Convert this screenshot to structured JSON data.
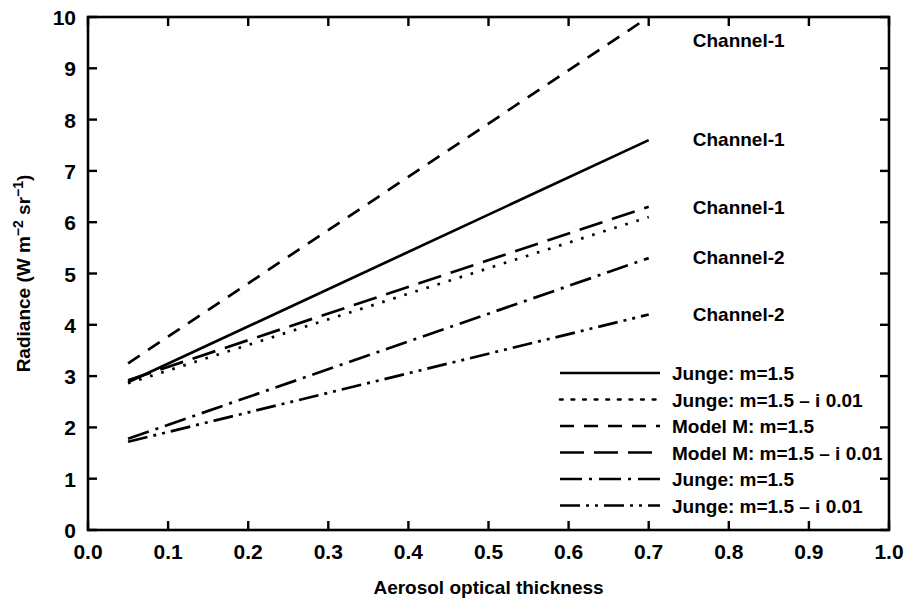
{
  "chart_data": {
    "type": "line",
    "title": "",
    "xlabel": "Aerosol optical thickness",
    "ylabel": "Radiance (W m-2 sr-1)",
    "ylabel_parts": {
      "pre": "Radiance (W m",
      "sup1": "−2",
      "mid": " sr",
      "sup2": "−1",
      "post": ")"
    },
    "xlim": [
      0.0,
      1.0
    ],
    "ylim": [
      0,
      10
    ],
    "xticks": [
      "0.0",
      "0.1",
      "0.2",
      "0.3",
      "0.4",
      "0.5",
      "0.6",
      "0.7",
      "0.8",
      "0.9",
      "1.0"
    ],
    "xtick_values": [
      0.0,
      0.1,
      0.2,
      0.3,
      0.4,
      0.5,
      0.6,
      0.7,
      0.8,
      0.9,
      1.0
    ],
    "yticks": [
      "0",
      "1",
      "2",
      "3",
      "4",
      "5",
      "6",
      "7",
      "8",
      "9",
      "10"
    ],
    "ytick_values": [
      0,
      1,
      2,
      3,
      4,
      5,
      6,
      7,
      8,
      9,
      10
    ],
    "grid": false,
    "legend_position": "lower-right-inside",
    "x": [
      0.05,
      0.7
    ],
    "series": [
      {
        "name": "Model M: m=1.5",
        "channel": "Channel-1",
        "style": "dashed",
        "dasharray": "14 10",
        "values": [
          3.25,
          10.0
        ]
      },
      {
        "name": "Junge: m=1.5",
        "channel": "Channel-1",
        "style": "solid",
        "dasharray": "none",
        "values": [
          2.88,
          7.6
        ]
      },
      {
        "name": "Model M: m=1.5 - i 0.01",
        "channel": "Channel-1",
        "style": "long-dash",
        "dasharray": "24 10",
        "values": [
          2.92,
          6.3
        ]
      },
      {
        "name": "Junge: m=1.5 - i 0.01",
        "channel": "Channel-1",
        "style": "dotted",
        "dasharray": "2.6 9",
        "values": [
          2.86,
          6.1
        ]
      },
      {
        "name": "Junge: m=1.5",
        "channel": "Channel-2",
        "style": "dash-dot",
        "dasharray": "22 7 3 7",
        "values": [
          1.78,
          5.3
        ]
      },
      {
        "name": "Junge: m=1.5 - i 0.01",
        "channel": "Channel-2",
        "style": "dash-dot-dot",
        "dasharray": "20 6 3 6 3 6",
        "values": [
          1.72,
          4.2
        ]
      }
    ],
    "curve_labels": [
      {
        "text": "Channel-1",
        "x": 0.755,
        "y": 9.55
      },
      {
        "text": "Channel-1",
        "x": 0.755,
        "y": 7.63
      },
      {
        "text": "Channel-1",
        "x": 0.755,
        "y": 6.3
      },
      {
        "text": "Channel-2",
        "x": 0.755,
        "y": 5.32
      },
      {
        "text": "Channel-2",
        "x": 0.755,
        "y": 4.22
      }
    ],
    "legend": [
      {
        "label": "Junge: m=1.5",
        "style": "solid",
        "dasharray": "none"
      },
      {
        "label": "Junge: m=1.5 – i 0.01",
        "style": "dotted",
        "dasharray": "2.6 9"
      },
      {
        "label": "Model M: m=1.5",
        "style": "dashed",
        "dasharray": "14 10"
      },
      {
        "label": "Model M: m=1.5 – i 0.01",
        "style": "long-dash",
        "dasharray": "24 10"
      },
      {
        "label": "Junge: m=1.5",
        "style": "dash-dot",
        "dasharray": "22 7 3 7"
      },
      {
        "label": "Junge: m=1.5 – i 0.01",
        "style": "dash-dot-dot",
        "dasharray": "20 6 3 6 3 6"
      }
    ],
    "colors": {
      "line": "#000000",
      "background": "#ffffff",
      "axis": "#000000"
    }
  }
}
